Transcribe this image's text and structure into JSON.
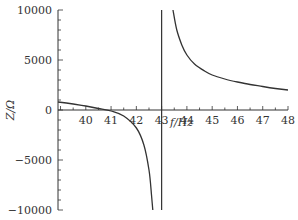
{
  "chart_data": {
    "type": "line",
    "title": "",
    "xlabel": "f/Hz",
    "ylabel": "Z/Ω",
    "xlim": [
      38.9,
      48
    ],
    "ylim": [
      -10000,
      10000
    ],
    "x_ticks": [
      40,
      41,
      42,
      43,
      44,
      45,
      46,
      47,
      48
    ],
    "y_ticks": [
      10000,
      5000,
      0,
      -5000,
      -10000
    ],
    "grid": false,
    "legend": null,
    "annotations": [
      {
        "type": "vertical_line",
        "x": 43,
        "label": "resonance asymptote"
      }
    ],
    "series": [
      {
        "name": "Z (below resonance)",
        "x": [
          38.9,
          39.5,
          40.0,
          40.5,
          41.0,
          41.5,
          42.0,
          42.3,
          42.5,
          42.6,
          42.65
        ],
        "y": [
          800,
          600,
          400,
          150,
          -100,
          -600,
          -1800,
          -3500,
          -6000,
          -8500,
          -10000
        ]
      },
      {
        "name": "Z (above resonance)",
        "x": [
          43.45,
          43.6,
          43.8,
          44.0,
          44.3,
          44.7,
          45.0,
          45.5,
          46.0,
          46.5,
          47.0,
          47.5,
          48.0
        ],
        "y": [
          10000,
          8000,
          6500,
          5500,
          4600,
          3900,
          3500,
          3100,
          2800,
          2550,
          2350,
          2150,
          2000
        ]
      }
    ]
  },
  "labels": {
    "xlabel": "f/Hz",
    "ylabel": "Z/Ω",
    "y_ticks": [
      "10000",
      "5000",
      "0",
      "−5000",
      "−10000"
    ],
    "x_ticks": [
      "40",
      "41",
      "42",
      "43",
      "44",
      "45",
      "46",
      "47",
      "48"
    ]
  }
}
